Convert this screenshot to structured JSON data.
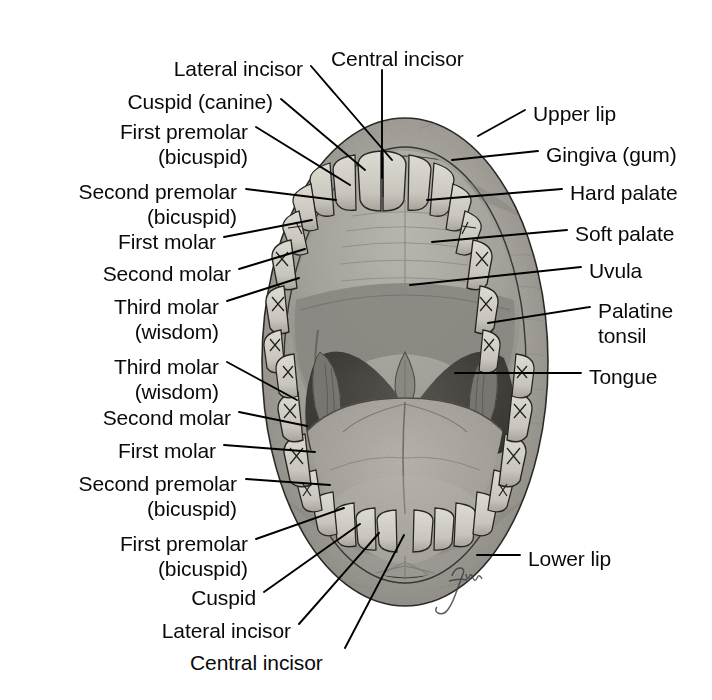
{
  "figure": {
    "artist_signature": "fiona"
  },
  "colors": {
    "lip_outer": "#9a9a9a",
    "lip_mid": "#b3b3b3",
    "gingiva": "#b8b4ad",
    "tooth": "#d8d5cd",
    "tooth_shadow": "#a9a59c",
    "palate": "#a3a09a",
    "hard_palate": "#b0ada6",
    "soft_palate": "#8e8b86",
    "oropharynx": "#4a4845",
    "tongue": "#a8a49d",
    "tonsil": "#7c7975",
    "outline": "#1a1a1a",
    "leader": "#000000",
    "text": "#0a0a0a",
    "background": "#ffffff"
  },
  "labels_left": [
    {
      "id": "lateral-incisor-upper",
      "lines": [
        "Lateral incisor"
      ],
      "x": 303,
      "y": 56,
      "align": "right"
    },
    {
      "id": "cuspid-canine-upper",
      "lines": [
        "Cuspid (canine)"
      ],
      "x": 273,
      "y": 89,
      "align": "right"
    },
    {
      "id": "first-premolar-upper",
      "lines": [
        "First premolar",
        "(bicuspid)"
      ],
      "x": 248,
      "y": 119,
      "align": "right"
    },
    {
      "id": "second-premolar-upper",
      "lines": [
        "Second premolar",
        "(bicuspid)"
      ],
      "x": 237,
      "y": 179,
      "align": "right"
    },
    {
      "id": "first-molar-upper",
      "lines": [
        "First molar"
      ],
      "x": 216,
      "y": 229,
      "align": "right"
    },
    {
      "id": "second-molar-upper",
      "lines": [
        "Second molar"
      ],
      "x": 231,
      "y": 261,
      "align": "right"
    },
    {
      "id": "third-molar-wisdom-upper",
      "lines": [
        "Third molar",
        "(wisdom)"
      ],
      "x": 219,
      "y": 294,
      "align": "right"
    },
    {
      "id": "third-molar-wisdom-lower",
      "lines": [
        "Third molar",
        "(wisdom)"
      ],
      "x": 219,
      "y": 354,
      "align": "right"
    },
    {
      "id": "second-molar-lower",
      "lines": [
        "Second molar"
      ],
      "x": 231,
      "y": 405,
      "align": "right"
    },
    {
      "id": "first-molar-lower",
      "lines": [
        "First molar"
      ],
      "x": 216,
      "y": 438,
      "align": "right"
    },
    {
      "id": "second-premolar-lower",
      "lines": [
        "Second premolar",
        "(bicuspid)"
      ],
      "x": 237,
      "y": 471,
      "align": "right"
    },
    {
      "id": "first-premolar-lower",
      "lines": [
        "First premolar",
        "(bicuspid)"
      ],
      "x": 248,
      "y": 531,
      "align": "right"
    },
    {
      "id": "cuspid-lower",
      "lines": [
        "Cuspid"
      ],
      "x": 256,
      "y": 585,
      "align": "right"
    },
    {
      "id": "lateral-incisor-lower",
      "lines": [
        "Lateral incisor"
      ],
      "x": 291,
      "y": 618,
      "align": "right"
    }
  ],
  "labels_top": [
    {
      "id": "central-incisor-upper",
      "lines": [
        "Central incisor"
      ],
      "x": 331,
      "y": 46,
      "align": "left"
    }
  ],
  "labels_bottom": [
    {
      "id": "central-incisor-lower",
      "lines": [
        "Central incisor"
      ],
      "x": 190,
      "y": 650,
      "align": "left"
    }
  ],
  "labels_right": [
    {
      "id": "upper-lip",
      "lines": [
        "Upper lip"
      ],
      "x": 533,
      "y": 101,
      "align": "left"
    },
    {
      "id": "gingiva-gum",
      "lines": [
        "Gingiva (gum)"
      ],
      "x": 546,
      "y": 142,
      "align": "left"
    },
    {
      "id": "hard-palate",
      "lines": [
        "Hard palate"
      ],
      "x": 570,
      "y": 180,
      "align": "left"
    },
    {
      "id": "soft-palate",
      "lines": [
        "Soft palate"
      ],
      "x": 575,
      "y": 221,
      "align": "left"
    },
    {
      "id": "uvula",
      "lines": [
        "Uvula"
      ],
      "x": 589,
      "y": 258,
      "align": "left"
    },
    {
      "id": "palatine-tonsil",
      "lines": [
        "Palatine",
        "tonsil"
      ],
      "x": 598,
      "y": 298,
      "align": "left"
    },
    {
      "id": "tongue",
      "lines": [
        "Tongue"
      ],
      "x": 589,
      "y": 364,
      "align": "left"
    },
    {
      "id": "lower-lip",
      "lines": [
        "Lower lip"
      ],
      "x": 528,
      "y": 546,
      "align": "left"
    }
  ],
  "leader_lines": [
    {
      "id": "leader-lateral-incisor-upper",
      "points": "311,66 392,160"
    },
    {
      "id": "leader-cuspid-canine-upper",
      "points": "281,99 365,170"
    },
    {
      "id": "leader-first-premolar-upper",
      "points": "256,127 350,185"
    },
    {
      "id": "leader-second-premolar-upper",
      "points": "246,189 336,200"
    },
    {
      "id": "leader-first-molar-upper",
      "points": "224,237 312,220"
    },
    {
      "id": "leader-second-molar-upper",
      "points": "239,269 305,249"
    },
    {
      "id": "leader-third-molar-wisdom-upper",
      "points": "227,301 299,278"
    },
    {
      "id": "leader-third-molar-wisdom-lower",
      "points": "227,362 297,400"
    },
    {
      "id": "leader-second-molar-lower",
      "points": "239,412 307,426"
    },
    {
      "id": "leader-first-molar-lower",
      "points": "224,445 315,452"
    },
    {
      "id": "leader-second-premolar-lower",
      "points": "246,479 330,485"
    },
    {
      "id": "leader-first-premolar-lower",
      "points": "256,539 344,508"
    },
    {
      "id": "leader-cuspid-lower",
      "points": "264,592 360,524"
    },
    {
      "id": "leader-lateral-incisor-lower",
      "points": "299,624 379,533"
    },
    {
      "id": "leader-central-incisor-upper",
      "points": "382,70 382,178"
    },
    {
      "id": "leader-central-incisor-lower",
      "points": "345,648 404,535"
    },
    {
      "id": "leader-upper-lip",
      "points": "525,110 478,136"
    },
    {
      "id": "leader-gingiva-gum",
      "points": "538,151 452,160"
    },
    {
      "id": "leader-hard-palate",
      "points": "562,189 427,200"
    },
    {
      "id": "leader-soft-palate",
      "points": "567,230 432,242"
    },
    {
      "id": "leader-uvula",
      "points": "581,267 410,285"
    },
    {
      "id": "leader-palatine-tonsil",
      "points": "590,307 488,323"
    },
    {
      "id": "leader-tongue",
      "points": "581,373 455,373"
    },
    {
      "id": "leader-lower-lip",
      "points": "520,555 477,555"
    }
  ],
  "anatomy_parts": [
    {
      "id": "upper-lip",
      "name": "Upper lip"
    },
    {
      "id": "lower-lip",
      "name": "Lower lip"
    },
    {
      "id": "gingiva",
      "name": "Gingiva (gum)"
    },
    {
      "id": "hard-palate",
      "name": "Hard palate"
    },
    {
      "id": "soft-palate",
      "name": "Soft palate"
    },
    {
      "id": "uvula",
      "name": "Uvula"
    },
    {
      "id": "palatine-tonsil-left",
      "name": "Palatine tonsil (left)"
    },
    {
      "id": "palatine-tonsil-right",
      "name": "Palatine tonsil (right)"
    },
    {
      "id": "tongue",
      "name": "Tongue"
    },
    {
      "id": "oropharynx",
      "name": "Oropharynx"
    },
    {
      "id": "upper-dental-arch",
      "name": "Upper dental arch"
    },
    {
      "id": "lower-dental-arch",
      "name": "Lower dental arch"
    }
  ]
}
